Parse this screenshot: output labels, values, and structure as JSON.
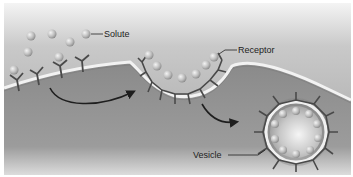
{
  "diagram": {
    "labels": {
      "solute": "Solute",
      "receptor": "Receptor",
      "vesicle": "Vesicle"
    },
    "colors": {
      "extracellular_top": "#e6e6e6",
      "extracellular_bottom": "#a9a9a9",
      "cytoplasm": "#8e8e8e",
      "membrane": "#f2f2f2",
      "receptor": "#4a4a4a",
      "solute": "#d2d2d2",
      "arrow": "#1e1e1e"
    },
    "stages": [
      "Solute binds receptors on flat membrane",
      "Membrane invaginates forming coated pit",
      "Pit pinches off into vesicle"
    ]
  }
}
